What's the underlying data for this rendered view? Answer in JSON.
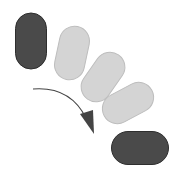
{
  "diagram": {
    "colors": {
      "background": "#ffffff",
      "dark_fill": "#4a4a4a",
      "dark_stroke": "#2e2e2e",
      "light_fill": "#d4d4d4",
      "light_stroke": "#bdbdbd",
      "arrow": "#444444"
    },
    "shapes": [
      {
        "id": "start",
        "style": "dark",
        "cx": 31,
        "cy": 41,
        "w": 31,
        "h": 56,
        "rotation": 0
      },
      {
        "id": "step-1",
        "style": "light",
        "cx": 72,
        "cy": 53,
        "w": 30,
        "h": 54,
        "rotation": 12
      },
      {
        "id": "step-2",
        "style": "light",
        "cx": 103,
        "cy": 77,
        "w": 30,
        "h": 54,
        "rotation": 35
      },
      {
        "id": "step-3",
        "style": "light",
        "cx": 128,
        "cy": 103,
        "w": 30,
        "h": 54,
        "rotation": 62
      },
      {
        "id": "end",
        "style": "dark",
        "cx": 140,
        "cy": 148,
        "w": 33,
        "h": 57,
        "rotation": 90
      }
    ],
    "arrow": {
      "path": "M 33 89 Q 70 86 86 118",
      "head": "80,114 93,110 94,134"
    }
  }
}
